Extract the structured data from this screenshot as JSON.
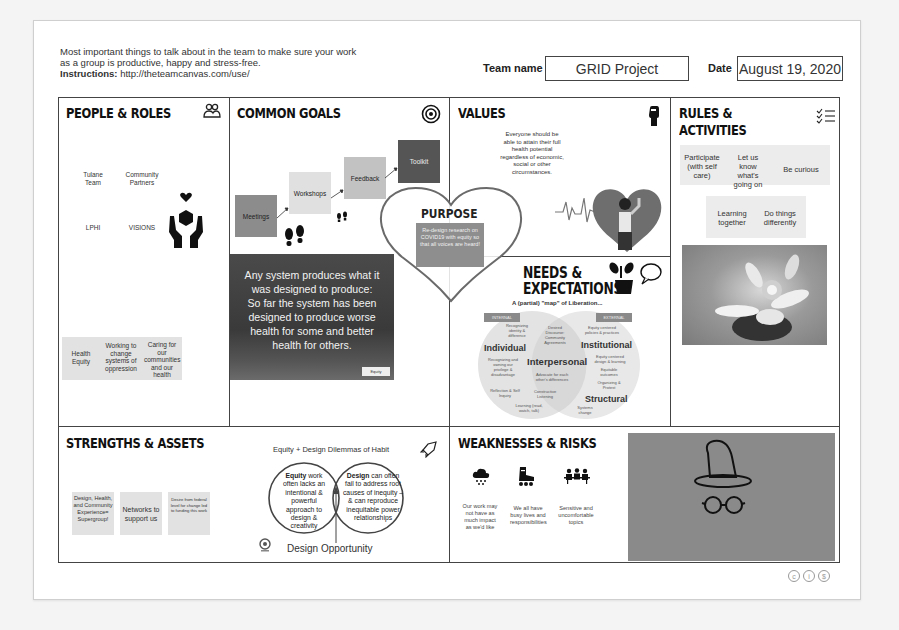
{
  "header": {
    "intro_line1": "Most important things to talk about in the team to make sure your work",
    "intro_line2": "as a group is productive, happy and stress-free.",
    "instructions_label": "Instructions:",
    "instructions_url": "http://theteamcanvas.com/use/",
    "team_name_label": "Team name",
    "team_name_value": "GRID Project",
    "date_label": "Date",
    "date_value": "August 19, 2020"
  },
  "people_roles": {
    "title": "PEOPLE & ROLES",
    "icon": "people-icon",
    "members": [
      "Tulane Team",
      "Community Partners",
      "LPHI",
      "VISIONS"
    ],
    "sticky": [
      "Health Equity",
      "Working to change systems of oppression",
      "Caring for our communities and our health"
    ]
  },
  "common_goals": {
    "title": "COMMON GOALS",
    "icon": "target-icon",
    "steps": [
      "Meetings",
      "Workshops",
      "Feedback",
      "Toolkit"
    ],
    "quote_lines": [
      "Any system produces what it",
      "was designed to produce:",
      "So far the system has been",
      "designed to produce worse",
      "health for some and better",
      "health for others."
    ],
    "quote_logo": "Equity"
  },
  "purpose": {
    "title": "PURPOSE",
    "text": "Re-design research on COVID19 with equity so that all voices are heard!"
  },
  "values": {
    "title": "VALUES",
    "icon": "fist-icon",
    "text": "Everyone should be able to attain their full health potential regardless of economic, social or other circumstances."
  },
  "rules_activities": {
    "title_line1": "RULES &",
    "title_line2": "ACTIVITIES",
    "icon": "checklist-icon",
    "items": [
      "Participate (with self care)",
      "Let us know what's going on",
      "Be curious",
      "Learning together",
      "Do things differently"
    ]
  },
  "needs_expectations": {
    "title_line1": "NEEDS &",
    "title_line2": "EXPECTATIONS",
    "icon": "plant-speech-icon",
    "map_title": "A (partial) \"map\" of Liberation...",
    "tags": [
      "INTERNAL",
      "EXTERNAL"
    ],
    "levels": [
      "Individual",
      "Interpersonal",
      "Institutional",
      "Structural"
    ],
    "notes": [
      "Recognizing identity & difference",
      "Desired Discourse: Community Agreements",
      "Equity centered policies & practices",
      "Recognizing and owning our privilege & disadvantage",
      "Advocate for each other's differences",
      "Equity centered design & learning",
      "Equitable outcomes",
      "Organizing & Protest",
      "Reflection & Self Inquiry",
      "Constructive Listening",
      "Learning (read, watch, talk)",
      "Systems change"
    ]
  },
  "strengths_assets": {
    "title": "STRENGTHS & ASSETS",
    "sticky": [
      "Design, Health, and Community Experience= Supergroup!",
      "Networks to support us",
      "Desire from federal level for change led to funding this work"
    ],
    "dilemma_title": "Equity + Design Dilemmas of Habit",
    "icon": "rocket-icon",
    "equity_bold": "Equity",
    "equity_text": "work often lacks an intentional & powerful approach to design & creativity",
    "design_bold": "Design",
    "design_text": "can often fail to address root causes of inequity – & can reproduce inequitable power relationships",
    "opportunity": "Design Opportunity"
  },
  "weaknesses_risks": {
    "title": "WEAKNESSES & RISKS",
    "items": [
      {
        "icon": "rain-cloud-icon",
        "text": "Our work may not have as much impact as we'd like"
      },
      {
        "icon": "rollerskate-icon",
        "text": "We all have busy lives and responsibilities"
      },
      {
        "icon": "meeting-people-icon",
        "text": "Sensitive and uncomfortable topics"
      }
    ],
    "image_icons": [
      "wizard-hat-icon",
      "glasses-icon"
    ]
  },
  "footer": {
    "icons": [
      "cc-icon",
      "by-icon",
      "nc-icon"
    ]
  }
}
